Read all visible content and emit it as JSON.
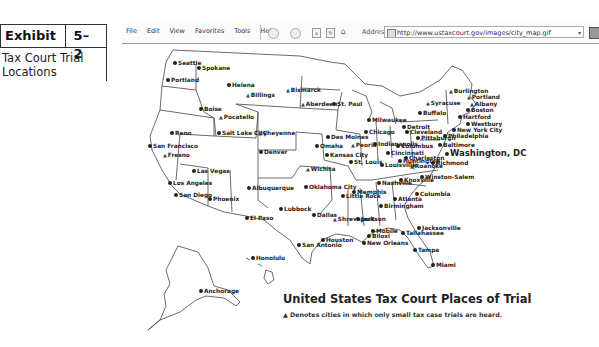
{
  "exhibit": {
    "label": "Exhibit",
    "number": "5–2",
    "description": "Tax Court Trial Locations"
  },
  "browser": {
    "menu": [
      "File",
      "Edit",
      "View",
      "Favorites",
      "Tools",
      "Help"
    ],
    "address_label": "Address",
    "url": "http://www.ustaxcourt.gov/images/city_map.gif",
    "go_label": "G"
  },
  "map": {
    "title": "United States Tax Court Places of Trial",
    "legend_symbol": "▲",
    "legend": "Denotes cities in which only small tax case trials are heard.",
    "cities": [
      {
        "name": "Seattle",
        "x": 173,
        "y": 60,
        "type": "dot"
      },
      {
        "name": "Spokane",
        "x": 197,
        "y": 65,
        "type": "dot"
      },
      {
        "name": "Portland",
        "x": 166,
        "y": 77,
        "type": "dot"
      },
      {
        "name": "Helena",
        "x": 227,
        "y": 82,
        "type": "dot"
      },
      {
        "name": "Billings",
        "x": 246,
        "y": 92,
        "type": "tri"
      },
      {
        "name": "Bismarck",
        "x": 286,
        "y": 87,
        "type": "tri"
      },
      {
        "name": "Aberdeen",
        "x": 301,
        "y": 101,
        "type": "tri"
      },
      {
        "name": "St. Paul",
        "x": 332,
        "y": 101,
        "type": "dot"
      },
      {
        "name": "Boise",
        "x": 199,
        "y": 106,
        "type": "dot"
      },
      {
        "name": "Pocatello",
        "x": 219,
        "y": 114,
        "type": "tri"
      },
      {
        "name": "Reno",
        "x": 170,
        "y": 130,
        "type": "dot"
      },
      {
        "name": "Salt Lake City",
        "x": 217,
        "y": 130,
        "type": "dot"
      },
      {
        "name": "Cheyenne",
        "x": 258,
        "y": 130,
        "type": "tri"
      },
      {
        "name": "San Francisco",
        "x": 148,
        "y": 143,
        "type": "dot"
      },
      {
        "name": "Denver",
        "x": 259,
        "y": 149,
        "type": "dot"
      },
      {
        "name": "Fresno",
        "x": 163,
        "y": 152,
        "type": "tri"
      },
      {
        "name": "Las Vegas",
        "x": 192,
        "y": 168,
        "type": "dot"
      },
      {
        "name": "Los Angeles",
        "x": 168,
        "y": 180,
        "type": "dot"
      },
      {
        "name": "San Diego",
        "x": 174,
        "y": 192,
        "type": "dot"
      },
      {
        "name": "Phoenix",
        "x": 208,
        "y": 196,
        "type": "dot"
      },
      {
        "name": "Albuquerque",
        "x": 247,
        "y": 185,
        "type": "dot"
      },
      {
        "name": "El Paso",
        "x": 245,
        "y": 215,
        "type": "dot"
      },
      {
        "name": "Lubbock",
        "x": 279,
        "y": 206,
        "type": "dot"
      },
      {
        "name": "Oklahoma City",
        "x": 304,
        "y": 184,
        "type": "dot"
      },
      {
        "name": "Dallas",
        "x": 312,
        "y": 212,
        "type": "dot"
      },
      {
        "name": "Wichita",
        "x": 306,
        "y": 166,
        "type": "tri"
      },
      {
        "name": "Omaha",
        "x": 315,
        "y": 143,
        "type": "dot"
      },
      {
        "name": "Des Moines",
        "x": 326,
        "y": 134,
        "type": "dot"
      },
      {
        "name": "Kansas City",
        "x": 325,
        "y": 152,
        "type": "dot"
      },
      {
        "name": "Peoria",
        "x": 351,
        "y": 142,
        "type": "tri"
      },
      {
        "name": "Milwaukee",
        "x": 367,
        "y": 117,
        "type": "dot"
      },
      {
        "name": "Chicago",
        "x": 364,
        "y": 129,
        "type": "dot"
      },
      {
        "name": "St. Louis",
        "x": 349,
        "y": 159,
        "type": "dot"
      },
      {
        "name": "Indianapolis",
        "x": 373,
        "y": 141,
        "type": "dot"
      },
      {
        "name": "Louisville",
        "x": 380,
        "y": 162,
        "type": "dot"
      },
      {
        "name": "Detroit",
        "x": 402,
        "y": 124,
        "type": "dot"
      },
      {
        "name": "Cleveland",
        "x": 405,
        "y": 129,
        "type": "dot"
      },
      {
        "name": "Columbus",
        "x": 396,
        "y": 143,
        "type": "dot"
      },
      {
        "name": "Cincinnati",
        "x": 386,
        "y": 150,
        "type": "dot"
      },
      {
        "name": "Pittsburgh",
        "x": 416,
        "y": 135,
        "type": "dot"
      },
      {
        "name": "Charleston",
        "x": 404,
        "y": 155,
        "type": "dot"
      },
      {
        "name": "Huntington",
        "x": 398,
        "y": 158,
        "type": "dot"
      },
      {
        "name": "Roanoke",
        "x": 410,
        "y": 163,
        "type": "tri"
      },
      {
        "name": "Richmond",
        "x": 431,
        "y": 160,
        "type": "dot"
      },
      {
        "name": "Nashville",
        "x": 377,
        "y": 180,
        "type": "dot"
      },
      {
        "name": "Knoxville",
        "x": 399,
        "y": 177,
        "type": "dot"
      },
      {
        "name": "Winston-Salem",
        "x": 420,
        "y": 174,
        "type": "dot"
      },
      {
        "name": "Memphis",
        "x": 352,
        "y": 189,
        "type": "dot"
      },
      {
        "name": "Little Rock",
        "x": 341,
        "y": 193,
        "type": "dot"
      },
      {
        "name": "Columbia",
        "x": 415,
        "y": 191,
        "type": "dot"
      },
      {
        "name": "Atlanta",
        "x": 393,
        "y": 196,
        "type": "dot"
      },
      {
        "name": "Birmingham",
        "x": 379,
        "y": 203,
        "type": "dot"
      },
      {
        "name": "Jackson",
        "x": 356,
        "y": 216,
        "type": "dot"
      },
      {
        "name": "Shreveport",
        "x": 333,
        "y": 216,
        "type": "tri"
      },
      {
        "name": "Mobile",
        "x": 371,
        "y": 228,
        "type": "dot"
      },
      {
        "name": "Biloxi",
        "x": 367,
        "y": 233,
        "type": "dot"
      },
      {
        "name": "New Orleans",
        "x": 362,
        "y": 240,
        "type": "dot"
      },
      {
        "name": "Houston",
        "x": 321,
        "y": 237,
        "type": "dot"
      },
      {
        "name": "San Antonio",
        "x": 297,
        "y": 242,
        "type": "dot"
      },
      {
        "name": "Jacksonville",
        "x": 417,
        "y": 225,
        "type": "dot"
      },
      {
        "name": "Tallahassee",
        "x": 401,
        "y": 230,
        "type": "dot"
      },
      {
        "name": "Tampa",
        "x": 413,
        "y": 247,
        "type": "dot"
      },
      {
        "name": "Miami",
        "x": 431,
        "y": 262,
        "type": "dot"
      },
      {
        "name": "Syracuse",
        "x": 426,
        "y": 100,
        "type": "tri"
      },
      {
        "name": "Buffalo",
        "x": 418,
        "y": 110,
        "type": "dot"
      },
      {
        "name": "Burlington",
        "x": 449,
        "y": 88,
        "type": "tri"
      },
      {
        "name": "Portland",
        "x": 467,
        "y": 94,
        "type": "tri"
      },
      {
        "name": "Albany",
        "x": 470,
        "y": 101,
        "type": "tri"
      },
      {
        "name": "Boston",
        "x": 466,
        "y": 107,
        "type": "dot"
      },
      {
        "name": "Hartford",
        "x": 458,
        "y": 114,
        "type": "dot"
      },
      {
        "name": "Westbury",
        "x": 466,
        "y": 121,
        "type": "dot"
      },
      {
        "name": "New York City",
        "x": 452,
        "y": 127,
        "type": "dot"
      },
      {
        "name": "Philadelphia",
        "x": 443,
        "y": 133,
        "type": "dot"
      },
      {
        "name": "Baltimore",
        "x": 438,
        "y": 142,
        "type": "dot"
      },
      {
        "name": "Washington, DC",
        "x": 445,
        "y": 150,
        "type": "dot",
        "big": true
      },
      {
        "name": "Honolulu",
        "x": 251,
        "y": 255,
        "type": "dot"
      },
      {
        "name": "Anchorage",
        "x": 199,
        "y": 288,
        "type": "dot"
      }
    ]
  }
}
